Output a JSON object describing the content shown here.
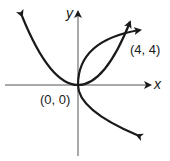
{
  "diagram": {
    "axes": {
      "x_label": "x",
      "y_label": "y"
    },
    "points": [
      {
        "label": "(0, 0)",
        "x": 0,
        "y": 0
      },
      {
        "label": "(4, 4)",
        "x": 4,
        "y": 4
      }
    ],
    "curves": [
      {
        "name": "upward-parabola",
        "equation": "y = x^2/4"
      },
      {
        "name": "rightward-parabola",
        "equation": "x = y^2/4"
      }
    ],
    "colors": {
      "ink": "#1a1a1a",
      "axis": "#555555",
      "background": "#ffffff"
    }
  }
}
